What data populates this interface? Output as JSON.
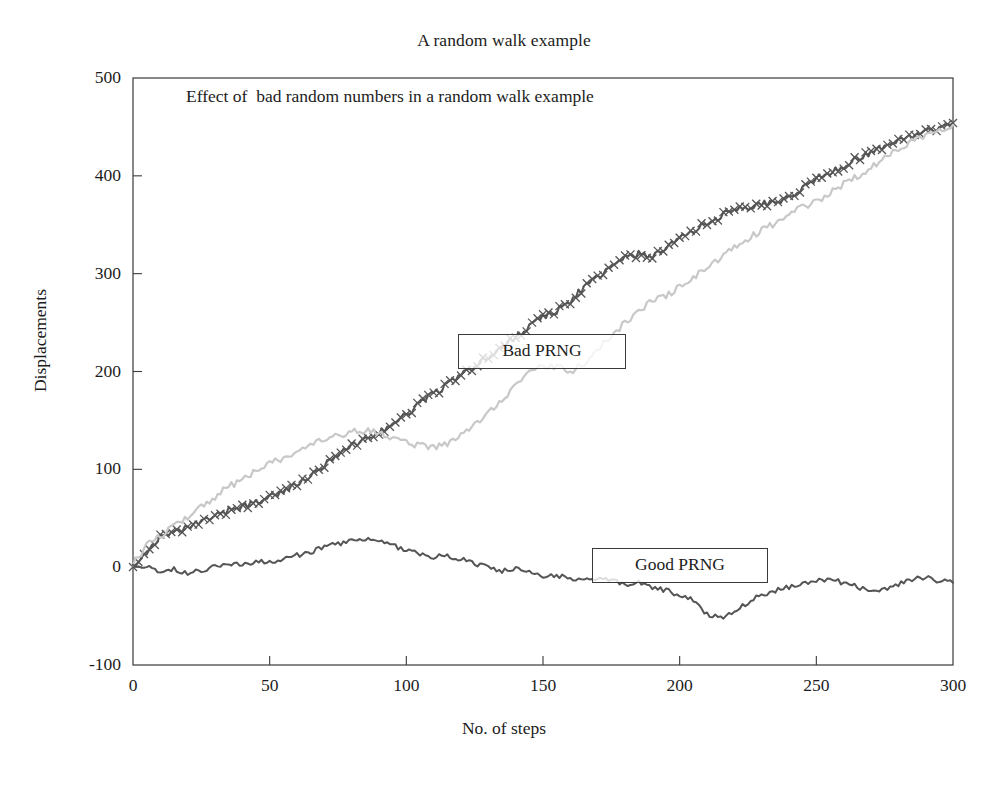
{
  "figure": {
    "title": "A random walk example",
    "subtitle": "Effect of  bad random numbers in a random walk example",
    "background_color": "#ffffff",
    "frame_color": "#3a3a3a"
  },
  "chart_data": {
    "type": "line",
    "title": "A random walk example",
    "subtitle": "Effect of  bad random numbers in a random walk example",
    "xlabel": "No. of steps",
    "ylabel": "Displacements",
    "xlim": [
      0,
      300
    ],
    "ylim": [
      -100,
      500
    ],
    "xticks": [
      0,
      50,
      100,
      150,
      200,
      250,
      300
    ],
    "yticks": [
      -100,
      0,
      100,
      200,
      300,
      400,
      500
    ],
    "xtick_labels": [
      "0",
      "50",
      "100",
      "150",
      "200",
      "250",
      "300"
    ],
    "ytick_labels": [
      "-100",
      "0",
      "100",
      "200",
      "300",
      "400",
      "500"
    ],
    "grid": false,
    "legend_position": "inline-annotation-boxes",
    "annotations": [
      {
        "label": "Bad PRNG",
        "x": 140,
        "y": 222
      },
      {
        "label": "Good PRNG",
        "x": 205,
        "y": -12
      }
    ],
    "series": [
      {
        "name": "Bad PRNG",
        "style": "x-markers-line",
        "color": "#555555",
        "x": [
          0,
          5,
          10,
          15,
          20,
          25,
          30,
          35,
          40,
          45,
          50,
          55,
          60,
          65,
          70,
          75,
          80,
          85,
          90,
          95,
          100,
          105,
          110,
          115,
          120,
          125,
          130,
          135,
          140,
          145,
          150,
          155,
          160,
          165,
          170,
          175,
          180,
          185,
          190,
          195,
          200,
          205,
          210,
          215,
          220,
          225,
          230,
          235,
          240,
          245,
          250,
          255,
          260,
          265,
          270,
          275,
          280,
          285,
          290,
          295,
          300
        ],
        "values": [
          2,
          16,
          30,
          34,
          40,
          46,
          52,
          58,
          62,
          66,
          72,
          78,
          84,
          92,
          104,
          116,
          124,
          130,
          138,
          146,
          156,
          168,
          178,
          186,
          196,
          206,
          214,
          224,
          236,
          246,
          256,
          262,
          272,
          286,
          296,
          306,
          316,
          320,
          318,
          326,
          336,
          344,
          352,
          358,
          368,
          366,
          372,
          372,
          378,
          388,
          396,
          404,
          410,
          418,
          424,
          430,
          436,
          440,
          444,
          450,
          454
        ]
      },
      {
        "name": "Bad PRNG secondary",
        "style": "line",
        "color": "#c8c8c8",
        "x": [
          0,
          5,
          10,
          15,
          20,
          25,
          30,
          35,
          40,
          45,
          50,
          55,
          60,
          65,
          70,
          75,
          80,
          85,
          90,
          95,
          100,
          105,
          110,
          115,
          120,
          125,
          130,
          135,
          140,
          145,
          150,
          155,
          160,
          165,
          170,
          175,
          180,
          185,
          190,
          195,
          200,
          205,
          210,
          215,
          220,
          225,
          230,
          235,
          240,
          245,
          250,
          255,
          260,
          265,
          270,
          275,
          280,
          285,
          290,
          295,
          300
        ],
        "values": [
          4,
          22,
          32,
          42,
          52,
          62,
          72,
          82,
          90,
          98,
          106,
          112,
          118,
          124,
          130,
          134,
          138,
          140,
          136,
          132,
          128,
          124,
          122,
          126,
          134,
          146,
          158,
          172,
          186,
          198,
          206,
          204,
          200,
          208,
          222,
          236,
          250,
          262,
          272,
          278,
          286,
          296,
          306,
          316,
          326,
          336,
          344,
          352,
          360,
          368,
          374,
          382,
          392,
          400,
          408,
          418,
          428,
          436,
          442,
          448,
          452
        ]
      },
      {
        "name": "Good PRNG",
        "style": "line",
        "color": "#555555",
        "x": [
          0,
          5,
          10,
          15,
          20,
          25,
          30,
          35,
          40,
          45,
          50,
          55,
          60,
          65,
          70,
          75,
          80,
          85,
          90,
          95,
          100,
          105,
          110,
          115,
          120,
          125,
          130,
          135,
          140,
          145,
          150,
          155,
          160,
          165,
          170,
          175,
          180,
          185,
          190,
          195,
          200,
          205,
          210,
          215,
          220,
          225,
          230,
          235,
          240,
          245,
          250,
          255,
          260,
          265,
          270,
          275,
          280,
          285,
          290,
          295,
          300
        ],
        "values": [
          3,
          0,
          -4,
          -2,
          -6,
          -3,
          1,
          4,
          2,
          6,
          4,
          8,
          12,
          16,
          20,
          24,
          27,
          28,
          26,
          22,
          18,
          14,
          10,
          12,
          8,
          4,
          0,
          -4,
          -2,
          -6,
          -10,
          -8,
          -12,
          -14,
          -10,
          -14,
          -18,
          -16,
          -20,
          -24,
          -28,
          -34,
          -48,
          -52,
          -44,
          -36,
          -28,
          -24,
          -20,
          -18,
          -14,
          -12,
          -16,
          -20,
          -24,
          -22,
          -18,
          -12,
          -10,
          -14,
          -16
        ]
      }
    ]
  },
  "axis": {
    "y_label": "Displacements",
    "x_label": "No. of steps"
  },
  "legend": {
    "bad_label": "Bad PRNG",
    "good_label": "Good PRNG"
  }
}
